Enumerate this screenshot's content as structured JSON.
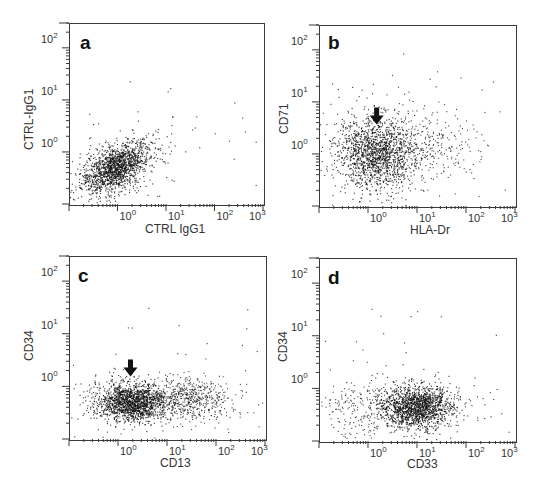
{
  "figure": {
    "panels": [
      {
        "id": "a",
        "letter": "a",
        "xlabel": "CTRL IgG1",
        "ylabel": "CTRL-IgG1",
        "arrow": false
      },
      {
        "id": "b",
        "letter": "b",
        "xlabel": "HLA-Dr",
        "ylabel": "CD71",
        "arrow": true
      },
      {
        "id": "c",
        "letter": "c",
        "xlabel": "CD13",
        "ylabel": "CD34",
        "arrow": true
      },
      {
        "id": "d",
        "letter": "d",
        "xlabel": "CD33",
        "ylabel": "CD34",
        "arrow": false
      }
    ],
    "x_tick_labels": [
      "10",
      "10",
      "10",
      "10"
    ],
    "x_tick_exponents": [
      "0",
      "1",
      "2",
      "3"
    ],
    "y_tick_labels": [
      "10",
      "10",
      "10"
    ],
    "y_tick_exponents": [
      "2",
      "1",
      "0"
    ],
    "point_color": "#111111",
    "axis_color": "#3a3a3a"
  },
  "chart_data": [
    {
      "type": "scatter",
      "title": "a",
      "xlabel": "CTRL IgG1",
      "ylabel": "CTRL-IgG1",
      "xscale": "log",
      "yscale": "log",
      "xlim": [
        0.1,
        1000
      ],
      "ylim": [
        0.1,
        300
      ],
      "x_ticks": [
        "10^0",
        "10^1",
        "10^2",
        "10^3"
      ],
      "y_ticks": [
        "10^0",
        "10^1",
        "10^2"
      ],
      "grid": false,
      "populations": [
        {
          "name": "main",
          "center": [
            0.9,
            0.5
          ],
          "spread_decades": [
            0.35,
            0.25
          ],
          "correlation": 0.5,
          "density": "high"
        }
      ],
      "annotations": []
    },
    {
      "type": "scatter",
      "title": "b",
      "xlabel": "HLA-Dr",
      "ylabel": "CD71",
      "xscale": "log",
      "yscale": "log",
      "xlim": [
        0.1,
        1000
      ],
      "ylim": [
        0.1,
        300
      ],
      "x_ticks": [
        "10^0",
        "10^1",
        "10^2",
        "10^3"
      ],
      "y_ticks": [
        "10^0",
        "10^1",
        "10^2"
      ],
      "grid": false,
      "populations": [
        {
          "name": "main",
          "center": [
            1.5,
            1.0
          ],
          "spread_decades": [
            0.4,
            0.35
          ],
          "density": "high"
        },
        {
          "name": "HLA-Dr tail",
          "center": [
            15,
            1.6
          ],
          "spread_decades": [
            0.6,
            0.3
          ],
          "density": "low"
        }
      ],
      "annotations": [
        {
          "type": "arrow",
          "direction": "down",
          "x": 1.5,
          "y": 6
        }
      ]
    },
    {
      "type": "scatter",
      "title": "c",
      "xlabel": "CD13",
      "ylabel": "CD34",
      "xscale": "log",
      "yscale": "log",
      "xlim": [
        0.1,
        1000
      ],
      "ylim": [
        0.1,
        300
      ],
      "x_ticks": [
        "10^0",
        "10^1",
        "10^2",
        "10^3"
      ],
      "y_ticks": [
        "10^0",
        "10^1",
        "10^2"
      ],
      "grid": false,
      "populations": [
        {
          "name": "CD13 low",
          "center": [
            1.8,
            0.5
          ],
          "spread_decades": [
            0.35,
            0.18
          ],
          "density": "high"
        },
        {
          "name": "CD13 high",
          "center": [
            25,
            0.6
          ],
          "spread_decades": [
            0.45,
            0.2
          ],
          "density": "medium"
        }
      ],
      "annotations": [
        {
          "type": "arrow",
          "direction": "down",
          "x": 1.8,
          "y": 2.5
        }
      ]
    },
    {
      "type": "scatter",
      "title": "d",
      "xlabel": "CD33",
      "ylabel": "CD34",
      "xscale": "log",
      "yscale": "log",
      "xlim": [
        0.1,
        1000
      ],
      "ylim": [
        0.1,
        300
      ],
      "x_ticks": [
        "10^0",
        "10^1",
        "10^2",
        "10^3"
      ],
      "y_ticks": [
        "10^0",
        "10^1",
        "10^2"
      ],
      "grid": false,
      "populations": [
        {
          "name": "main",
          "center": [
            10,
            0.45
          ],
          "spread_decades": [
            0.35,
            0.2
          ],
          "density": "high"
        },
        {
          "name": "low tail",
          "center": [
            0.7,
            0.4
          ],
          "spread_decades": [
            0.5,
            0.25
          ],
          "density": "low"
        }
      ],
      "annotations": []
    }
  ]
}
